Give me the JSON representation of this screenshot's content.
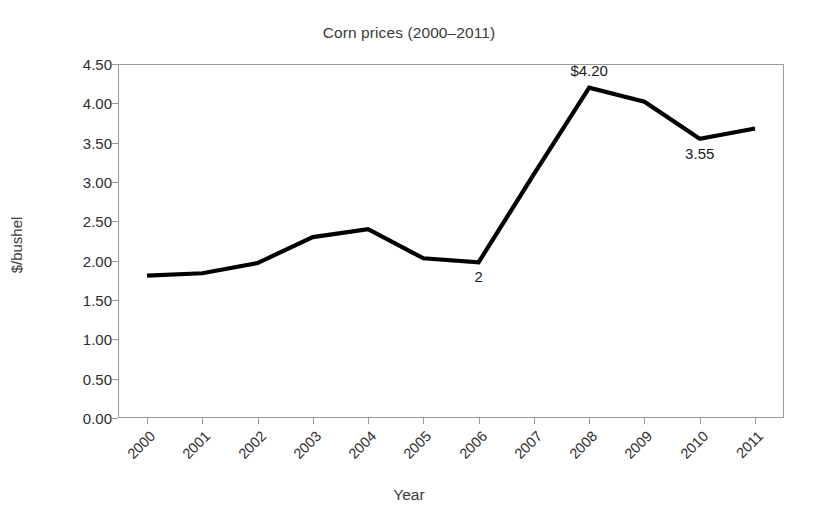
{
  "chart_data": {
    "type": "line",
    "title": "Corn prices (2000–2011)",
    "xlabel": "Year",
    "ylabel": "$/bushel",
    "categories": [
      "2000",
      "2001",
      "2002",
      "2003",
      "2004",
      "2005",
      "2006",
      "2007",
      "2008",
      "2009",
      "2010",
      "2011"
    ],
    "x": [
      2000,
      2001,
      2002,
      2003,
      2004,
      2005,
      2006,
      2007,
      2008,
      2009,
      2010,
      2011
    ],
    "values": [
      1.81,
      1.84,
      1.97,
      2.3,
      2.4,
      2.03,
      1.98,
      3.1,
      4.2,
      4.02,
      3.55,
      3.68
    ],
    "series": [
      {
        "name": "Corn price",
        "values": [
          1.81,
          1.84,
          1.97,
          2.3,
          2.4,
          2.03,
          1.98,
          3.1,
          4.2,
          4.02,
          3.55,
          3.68
        ],
        "color": "#000000"
      }
    ],
    "ylim": [
      0.0,
      4.5
    ],
    "ytick_labels": [
      "0.00",
      "0.50",
      "1.00",
      "1.50",
      "2.00",
      "2.50",
      "3.00",
      "3.50",
      "4.00",
      "4.50"
    ],
    "ytick_values": [
      0.0,
      0.5,
      1.0,
      1.5,
      2.0,
      2.5,
      3.0,
      3.5,
      4.0,
      4.5
    ],
    "grid": false,
    "legend": false,
    "legend_position": "none",
    "xtick_rotation": -45,
    "frame": "box",
    "annotations": [
      {
        "text": "$4.20",
        "year": "2008",
        "value": 4.2,
        "position": "above"
      },
      {
        "text": "3.55",
        "year": "2010",
        "value": 3.55,
        "position": "below"
      },
      {
        "text": "2",
        "year": "2006",
        "value": 1.98,
        "position": "below"
      }
    ]
  },
  "style": {
    "line_color": "#000000",
    "axis_color": "#9a9a9a",
    "text_color": "#2d2d2d",
    "title_color": "#3b3b3b",
    "background": "#ffffff"
  }
}
